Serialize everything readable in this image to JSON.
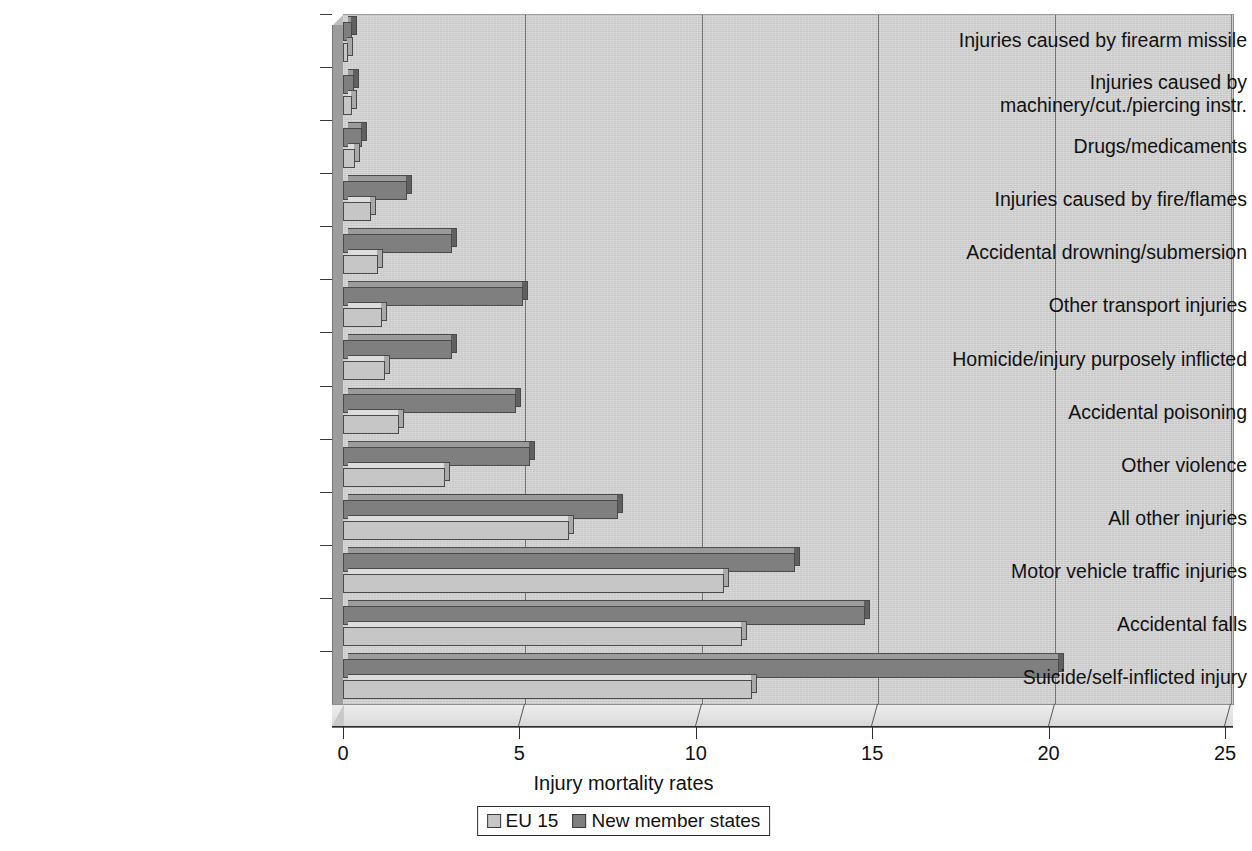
{
  "chart_data": {
    "type": "bar",
    "orientation": "horizontal",
    "title": "",
    "xlabel": "Injury mortality rates",
    "ylabel": "",
    "xlim": [
      0,
      25
    ],
    "xticks": [
      0,
      5,
      10,
      15,
      20,
      25
    ],
    "xtick_labels": [
      "0",
      "5",
      "10",
      "15",
      "20",
      "25"
    ],
    "grid": true,
    "legend_position": "bottom",
    "categories": [
      "Injuries caused by firearm missile",
      "Injuries caused by machinery/cut./piercing instr.",
      "Drugs/medicaments",
      "Injuries caused by fire/flames",
      "Accidental drowning/submersion",
      "Other transport injuries",
      "Homicide/injury purposely inflicted",
      "Accidental poisoning",
      "Other violence",
      "All other injuries",
      "Motor vehicle traffic injuries",
      "Accidental falls",
      "Suicide/self-inflicted injury"
    ],
    "series": [
      {
        "name": "EU 15",
        "color": "#c6c6c6",
        "values": [
          0.15,
          0.25,
          0.35,
          0.8,
          1.0,
          1.1,
          1.2,
          1.6,
          2.9,
          6.4,
          10.8,
          11.3,
          11.6
        ]
      },
      {
        "name": "New member states",
        "color": "#7f7f7f",
        "values": [
          0.25,
          0.3,
          0.55,
          1.8,
          3.1,
          5.1,
          3.1,
          4.9,
          5.3,
          7.8,
          12.8,
          14.8,
          20.3
        ]
      }
    ]
  },
  "category_label_lines": [
    [
      "Injuries caused by firearm missile"
    ],
    [
      "Injuries caused by",
      "machinery/cut./piercing instr."
    ],
    [
      "Drugs/medicaments"
    ],
    [
      "Injuries caused by fire/flames"
    ],
    [
      "Accidental drowning/submersion"
    ],
    [
      "Other transport injuries"
    ],
    [
      "Homicide/injury purposely inflicted"
    ],
    [
      "Accidental poisoning"
    ],
    [
      "Other violence"
    ],
    [
      "All other injuries"
    ],
    [
      "Motor vehicle traffic injuries"
    ],
    [
      "Accidental falls"
    ],
    [
      "Suicide/self-inflicted injury"
    ]
  ],
  "legend": {
    "items": [
      {
        "label": "EU 15",
        "swatch": "eu"
      },
      {
        "label": "New member states",
        "swatch": "nms"
      }
    ]
  },
  "colors": {
    "eu15": "#c6c6c6",
    "new_member_states": "#7f7f7f",
    "plot_background": "#d2d2d2",
    "gridline": "#6e6e6e",
    "axis": "#2b2b2b"
  }
}
